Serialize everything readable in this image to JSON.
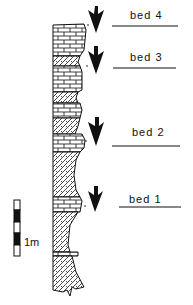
{
  "diagram": {
    "type": "stratigraphic-column",
    "beds": [
      {
        "label": "bed 4",
        "label_y": 18,
        "line_y": 25,
        "arrow_y": 6
      },
      {
        "label": "bed 3",
        "label_y": 57,
        "line_y": 66,
        "arrow_y": 46
      },
      {
        "label": "bed 2",
        "label_y": 132,
        "line_y": 140,
        "arrow_y": 117
      },
      {
        "label": "bed 1",
        "label_y": 196,
        "line_y": 205,
        "arrow_y": 186
      }
    ],
    "scale_bar": {
      "label": "1m"
    },
    "colors": {
      "ink": "#111111",
      "background": "#ffffff"
    },
    "lithologies": [
      "limestone (brick pattern)",
      "marl/shale (hatched stipple)"
    ]
  }
}
